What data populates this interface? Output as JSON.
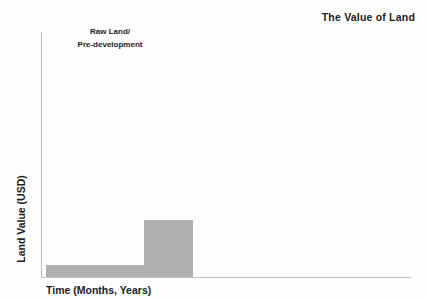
{
  "chart_data": {
    "type": "bar",
    "title": "The Value of Land",
    "xlabel": "Time (Months, Years)",
    "ylabel": "Land Value (USD)",
    "categories": [
      "Raw Land / Pre-development",
      "Entitled Land"
    ],
    "values": [
      12,
      57
    ],
    "ylim": [
      0,
      246
    ],
    "grid": false,
    "legend": false,
    "bar_color": "#b0b0b0",
    "axis_color": "#b9b9b9",
    "text_color": "#1c1c1c",
    "background": "#ffffff",
    "annotations": [
      {
        "name": "raw-land-annotation",
        "line1": "Raw Land/",
        "line2": "Pre-development"
      }
    ]
  },
  "chart": {
    "title": "The Value of Land",
    "axes": {
      "y_title": "Land Value (USD)",
      "x_title": "Time (Months, Years)"
    },
    "annotation": {
      "line1": "Raw Land/",
      "line2": "Pre-development"
    }
  }
}
